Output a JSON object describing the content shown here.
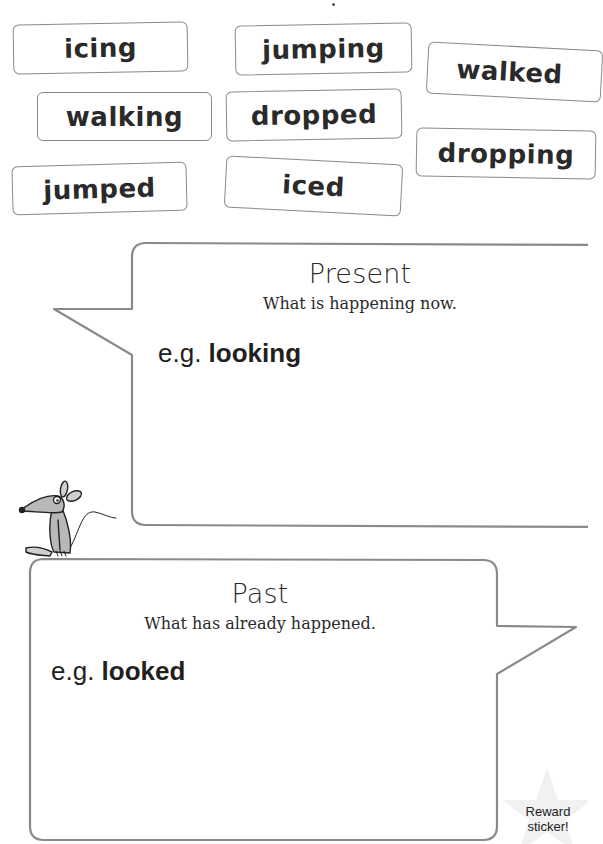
{
  "word_cards": [
    {
      "label": "icing"
    },
    {
      "label": "jumping"
    },
    {
      "label": "walked"
    },
    {
      "label": "walking"
    },
    {
      "label": "dropped"
    },
    {
      "label": "dropping"
    },
    {
      "label": "jumped"
    },
    {
      "label": "iced"
    }
  ],
  "present_box": {
    "title": "Present",
    "subtitle": "What is happening now.",
    "example_prefix": "e.g.",
    "example_word": "looking"
  },
  "past_box": {
    "title": "Past",
    "subtitle": "What has already happened.",
    "example_prefix": "e.g.",
    "example_word": "looked"
  },
  "reward": {
    "line1": "Reward",
    "line2": "sticker!"
  },
  "colors": {
    "border": "#8a8a8a",
    "text": "#231f20",
    "star": "#f1f1f1"
  }
}
